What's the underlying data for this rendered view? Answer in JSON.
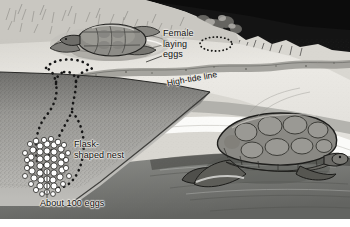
{
  "figure": {
    "kind": "illustration",
    "background_color": "#ffffff"
  },
  "labels": {
    "female_laying_eggs": "Female\nlaying\neggs",
    "high_tide_line": "High-tide line",
    "flask_shaped_nest": "Flask-\nshaped nest",
    "about_100_eggs": "About 100 eggs"
  },
  "annotations": {
    "buried_nest_marker": "dotted-ellipse-marker",
    "nest_outline": "dotted-flask-outline",
    "egg_cluster_leader": "leader-line"
  },
  "scene_elements": {
    "upper_turtle": "female-turtle-in-body-pit",
    "lower_turtle": "turtle-emerging-from-surf",
    "vegetation": "dark-treeline",
    "dry_sand": "upper-beach",
    "wet_sand": "swash-zone",
    "surf_foam": "white-foam-band",
    "water": "ocean",
    "sand_cross_section": "cutaway-sand-block",
    "egg_cluster": "clutch-of-eggs"
  },
  "colors": {
    "sand_light": "#e9e7e2",
    "sand_cut": "#bdbcb8",
    "wet_sand": "#9a9a96",
    "foam": "#fafaf8",
    "water_dark": "#6f706d",
    "vegetation_dark": "#141414",
    "ink": "#111111",
    "turtle_shell": "#8c8c88",
    "egg_fill": "#ffffff"
  },
  "counts": {
    "eggs_drawn": 52,
    "eggs_stated": 100
  }
}
